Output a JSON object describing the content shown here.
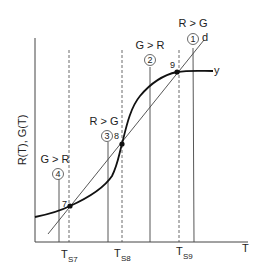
{
  "diagram": {
    "y_axis_label": "R(T), G(T)",
    "x_axis_label": "T",
    "curve_label": "y",
    "line_label": "d",
    "equilibria": [
      {
        "id": "7",
        "label": "7",
        "tick": "T",
        "tick_sub": "S7"
      },
      {
        "id": "8",
        "label": "8",
        "tick": "T",
        "tick_sub": "S8"
      },
      {
        "id": "9",
        "label": "9",
        "tick": "T",
        "tick_sub": "S9"
      }
    ],
    "regions": [
      {
        "number": "1",
        "relation": "R > G"
      },
      {
        "number": "2",
        "relation": "G > R"
      },
      {
        "number": "3",
        "relation": "R > G"
      },
      {
        "number": "4",
        "relation": "G > R"
      }
    ]
  },
  "colors": {
    "ink": "#222222",
    "background": "#ffffff"
  }
}
